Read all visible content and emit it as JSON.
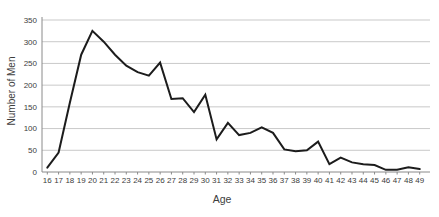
{
  "chart_data": {
    "type": "line",
    "title": "",
    "xlabel": "Age",
    "ylabel": "Number of Men",
    "x": [
      16,
      17,
      18,
      19,
      20,
      21,
      22,
      23,
      24,
      25,
      26,
      27,
      28,
      29,
      30,
      31,
      32,
      33,
      34,
      35,
      36,
      37,
      38,
      39,
      40,
      41,
      42,
      43,
      44,
      45,
      46,
      47,
      48,
      49
    ],
    "series": [
      {
        "name": "Number of Men",
        "values": [
          10,
          45,
          160,
          270,
          325,
          300,
          270,
          245,
          230,
          222,
          252,
          168,
          170,
          138,
          178,
          75,
          113,
          85,
          90,
          103,
          90,
          52,
          48,
          50,
          70,
          18,
          33,
          22,
          18,
          16,
          5,
          5,
          11,
          7
        ]
      }
    ],
    "yticks": [
      0,
      50,
      100,
      150,
      200,
      250,
      300,
      350
    ],
    "ylim": [
      0,
      350
    ],
    "grid": "horizontal",
    "legend": false,
    "colors": {
      "line": "#1c1c1c",
      "grid": "#c9c9c9",
      "axis": "#8a8a8a",
      "text": "#3d3d3d",
      "background": "#ffffff"
    }
  }
}
